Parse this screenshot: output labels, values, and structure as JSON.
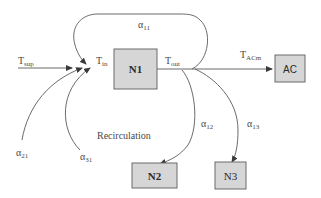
{
  "diagram": {
    "nodes": [
      {
        "id": "N1",
        "label": "N1"
      },
      {
        "id": "AC",
        "label": "AC"
      },
      {
        "id": "N2",
        "label": "N2"
      },
      {
        "id": "N3",
        "label": "N3"
      }
    ],
    "labels": {
      "t_sup": {
        "main": "T",
        "sub": "sup"
      },
      "t_in": {
        "main": "T",
        "sub": "in"
      },
      "t_out": {
        "main": "T",
        "sub": "out"
      },
      "t_acm": {
        "main": "T",
        "sub": "ACm"
      },
      "alpha_11": {
        "main": "α",
        "sub": "11"
      },
      "alpha_21": {
        "main": "α",
        "sub": "21"
      },
      "alpha_31": {
        "main": "α",
        "sub": "31"
      },
      "alpha_12": {
        "main": "α",
        "sub": "12"
      },
      "alpha_13": {
        "main": "α",
        "sub": "13"
      },
      "recirculation": "Recirculation"
    },
    "edges": [
      {
        "from": "T_sup",
        "to": "N1",
        "label": "T_sup"
      },
      {
        "from": "N1",
        "to": "AC",
        "label": "T_ACm"
      },
      {
        "from": "N1",
        "to": "N1",
        "label": "α11"
      },
      {
        "from": "external",
        "to": "N1",
        "label": "α21"
      },
      {
        "from": "external",
        "to": "N1",
        "label": "α31"
      },
      {
        "from": "N1",
        "to": "N2",
        "label": "α12"
      },
      {
        "from": "N1",
        "to": "N3",
        "label": "α13"
      }
    ],
    "colors": {
      "box_fill": "#d6d6d6",
      "box_stroke": "#6a6a6a",
      "line": "#5a5a5a",
      "text": "#4a4a4a"
    }
  }
}
